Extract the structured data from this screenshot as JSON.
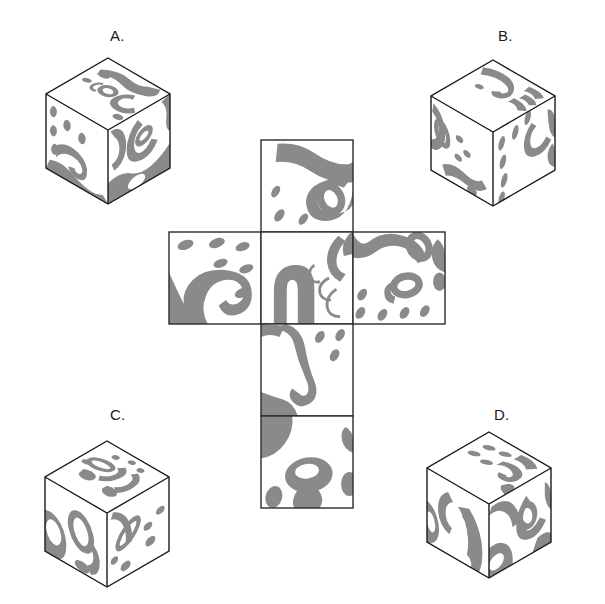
{
  "page": {
    "kind": "spatial-reasoning-multiple-choice",
    "background_color": "#ffffff",
    "pattern_fill_color": "#8a8a8a",
    "outline_color": "#2b2b2b"
  },
  "choices": [
    {
      "id": "A",
      "label": "A.",
      "position": "top-left"
    },
    {
      "id": "B",
      "label": "B.",
      "position": "top-right"
    },
    {
      "id": "C",
      "label": "C.",
      "position": "bottom-left"
    },
    {
      "id": "D",
      "label": "D.",
      "position": "bottom-right"
    }
  ],
  "net": {
    "name": "cube-net-cross",
    "shape": "latin-cross",
    "cell_size_px": 92,
    "faces": [
      {
        "name": "net-face-top",
        "row": 0,
        "col": 1,
        "pattern": "blobs-and-ring-with-dashes"
      },
      {
        "name": "net-face-left",
        "row": 1,
        "col": 0,
        "pattern": "spiral-swirl-with-dashes"
      },
      {
        "name": "net-face-center",
        "row": 1,
        "col": 1,
        "pattern": "large-arch-with-tendrils"
      },
      {
        "name": "net-face-right",
        "row": 1,
        "col": 2,
        "pattern": "rings-and-dash-field"
      },
      {
        "name": "net-face-below-center",
        "row": 2,
        "col": 1,
        "pattern": "large-s-hook-with-dashes"
      },
      {
        "name": "net-face-bottom",
        "row": 3,
        "col": 1,
        "pattern": "ring-and-blobs"
      }
    ]
  },
  "cubes": {
    "A": {
      "name": "answer-cube-a",
      "faces": [
        "top",
        "left",
        "right"
      ]
    },
    "B": {
      "name": "answer-cube-b",
      "faces": [
        "top",
        "left",
        "right"
      ]
    },
    "C": {
      "name": "answer-cube-c",
      "faces": [
        "top",
        "left",
        "right"
      ]
    },
    "D": {
      "name": "answer-cube-d",
      "faces": [
        "top",
        "left",
        "right"
      ]
    }
  }
}
